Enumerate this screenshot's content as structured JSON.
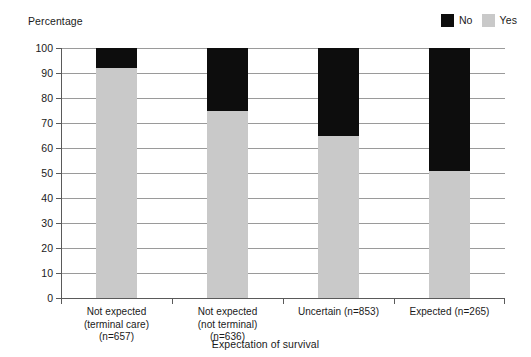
{
  "chart_data": {
    "type": "bar",
    "stacked": true,
    "percent": true,
    "title": "",
    "ylabel": "Percentage",
    "xlabel": "Expectation of survival",
    "ylim": [
      0,
      100
    ],
    "yticks": [
      0,
      10,
      20,
      30,
      40,
      50,
      60,
      70,
      80,
      90,
      100
    ],
    "grid": "horizontal",
    "legend_position": "top-right",
    "categories": [
      "Not expected (terminal care) (n=657)",
      "Not expected (not terminal) (n=636)",
      "Uncertain (n=853)",
      "Expected (n=265)"
    ],
    "category_lines": [
      [
        "Not expected",
        "(terminal care)",
        "(n=657)"
      ],
      [
        "Not expected",
        "(not terminal)",
        "(n=636)"
      ],
      [
        "Uncertain (n=853)"
      ],
      [
        "Expected (n=265)"
      ]
    ],
    "series": [
      {
        "name": "Yes",
        "color": "#c9c9c9",
        "values": [
          92,
          75,
          65,
          51
        ]
      },
      {
        "name": "No",
        "color": "#0d0d0d",
        "values": [
          8,
          25,
          35,
          49
        ]
      }
    ],
    "legend_order": [
      "No",
      "Yes"
    ]
  },
  "legend": {
    "entries": [
      {
        "label": "No",
        "color": "#0d0d0d"
      },
      {
        "label": "Yes",
        "color": "#c9c9c9"
      }
    ]
  },
  "axes": {
    "y_title": "Percentage",
    "x_title": "Expectation of survival",
    "y_tick_labels": [
      "100",
      "90",
      "80",
      "70",
      "60",
      "50",
      "40",
      "30",
      "20",
      "10",
      "0"
    ]
  },
  "colors": {
    "no": "#0d0d0d",
    "yes": "#c9c9c9",
    "gridline": "#9a9a9a",
    "axis": "#5a5a5a",
    "text": "#1a1a1a",
    "background": "#ffffff"
  }
}
